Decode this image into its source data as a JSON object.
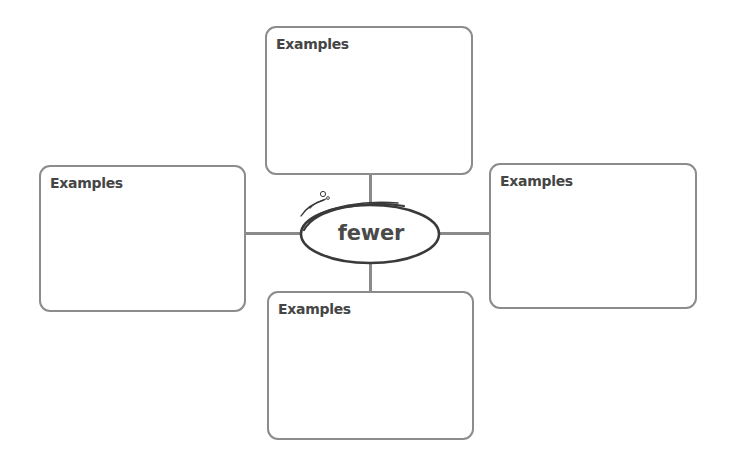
{
  "diagram": {
    "type": "concept-map",
    "center": {
      "word": "fewer"
    },
    "boxes": [
      {
        "position": "top",
        "label": "Examples",
        "content": ""
      },
      {
        "position": "left",
        "label": "Examples",
        "content": ""
      },
      {
        "position": "right",
        "label": "Examples",
        "content": ""
      },
      {
        "position": "bottom",
        "label": "Examples",
        "content": ""
      }
    ],
    "colors": {
      "border": "#8c8c8c",
      "text": "#454545",
      "ellipse": "#3a3a3a",
      "background": "#ffffff"
    }
  }
}
